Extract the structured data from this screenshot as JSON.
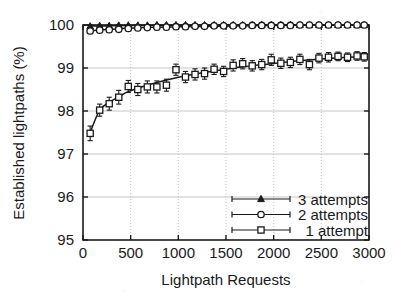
{
  "chart_data": {
    "type": "line",
    "title": "",
    "xlabel": "Lightpath Requests",
    "ylabel": "Established lightpaths (%)",
    "xlim": [
      0,
      3000
    ],
    "ylim": [
      95,
      100
    ],
    "xticks": [
      0,
      500,
      1000,
      1500,
      2000,
      2500,
      3000
    ],
    "yticks": [
      95,
      96,
      97,
      98,
      99,
      100
    ],
    "grid": true,
    "legend_position": "bottom-right",
    "x": [
      75,
      175,
      275,
      375,
      475,
      575,
      675,
      775,
      875,
      975,
      1075,
      1175,
      1275,
      1375,
      1475,
      1575,
      1675,
      1775,
      1875,
      1975,
      2075,
      2175,
      2275,
      2375,
      2475,
      2575,
      2675,
      2775,
      2875,
      2950
    ],
    "series": [
      {
        "name": "3 attempts",
        "marker": "triangle",
        "values": [
          99.97,
          99.98,
          99.98,
          99.99,
          99.99,
          99.99,
          99.99,
          100.0,
          100.0,
          100.0,
          100.0,
          100.0,
          100.0,
          100.0,
          100.0,
          100.0,
          100.0,
          100.0,
          100.0,
          100.0,
          100.0,
          100.0,
          100.0,
          100.0,
          100.0,
          100.0,
          100.0,
          100.0,
          100.0,
          100.0
        ],
        "errors": [
          0.03,
          0.02,
          0.02,
          0.02,
          0.01,
          0.01,
          0.01,
          0.01,
          0.01,
          0.01,
          0.01,
          0.01,
          0.01,
          0.01,
          0.0,
          0.0,
          0.0,
          0.0,
          0.0,
          0.0,
          0.0,
          0.0,
          0.0,
          0.0,
          0.0,
          0.0,
          0.0,
          0.0,
          0.0,
          0.0
        ]
      },
      {
        "name": "2 attempts",
        "marker": "circle",
        "values": [
          99.86,
          99.88,
          99.89,
          99.9,
          99.92,
          99.93,
          99.94,
          99.95,
          99.95,
          99.96,
          99.96,
          99.97,
          99.97,
          99.98,
          99.98,
          99.98,
          99.98,
          99.99,
          99.99,
          99.99,
          99.99,
          99.99,
          100.0,
          100.0,
          100.0,
          100.0,
          100.0,
          100.0,
          100.0,
          100.0
        ],
        "errors": [
          0.06,
          0.05,
          0.05,
          0.05,
          0.04,
          0.04,
          0.03,
          0.03,
          0.03,
          0.03,
          0.02,
          0.02,
          0.02,
          0.02,
          0.02,
          0.02,
          0.01,
          0.01,
          0.01,
          0.01,
          0.01,
          0.01,
          0.01,
          0.01,
          0.01,
          0.01,
          0.01,
          0.01,
          0.0,
          0.0
        ]
      },
      {
        "name": "1 attempt",
        "marker": "square",
        "values": [
          97.48,
          98.02,
          98.17,
          98.32,
          98.57,
          98.5,
          98.56,
          98.56,
          98.6,
          98.96,
          98.79,
          98.85,
          98.87,
          98.97,
          98.92,
          99.06,
          99.1,
          99.05,
          99.08,
          99.19,
          99.11,
          99.13,
          99.2,
          99.08,
          99.23,
          99.25,
          99.27,
          99.25,
          99.28,
          99.26
        ],
        "errors": [
          0.17,
          0.14,
          0.15,
          0.16,
          0.14,
          0.14,
          0.14,
          0.14,
          0.14,
          0.13,
          0.13,
          0.13,
          0.13,
          0.12,
          0.12,
          0.13,
          0.12,
          0.12,
          0.12,
          0.13,
          0.12,
          0.12,
          0.12,
          0.12,
          0.11,
          0.11,
          0.1,
          0.1,
          0.1,
          0.1
        ]
      }
    ],
    "fit_curves": [
      {
        "name": "3 attempts",
        "points": [
          [
            75,
            99.975
          ],
          [
            300,
            99.985
          ],
          [
            700,
            99.993
          ],
          [
            1200,
            99.998
          ],
          [
            2000,
            100.0
          ],
          [
            3000,
            100.0
          ]
        ]
      },
      {
        "name": "2 attempts",
        "points": [
          [
            75,
            99.865
          ],
          [
            300,
            99.9
          ],
          [
            700,
            99.945
          ],
          [
            1200,
            99.968
          ],
          [
            2000,
            99.99
          ],
          [
            3000,
            100.0
          ]
        ]
      },
      {
        "name": "1 attempt",
        "points": [
          [
            75,
            97.5
          ],
          [
            175,
            98.02
          ],
          [
            275,
            98.2
          ],
          [
            375,
            98.33
          ],
          [
            475,
            98.45
          ],
          [
            675,
            98.6
          ],
          [
            875,
            98.72
          ],
          [
            1075,
            98.82
          ],
          [
            1375,
            98.93
          ],
          [
            1675,
            99.03
          ],
          [
            1975,
            99.1
          ],
          [
            2275,
            99.17
          ],
          [
            2575,
            99.22
          ],
          [
            2950,
            99.27
          ]
        ]
      }
    ]
  },
  "axes": {
    "y_title": "Established lightpaths (%)",
    "x_title": "Lightpath Requests",
    "x_tick_labels": [
      "0",
      "500",
      "1000",
      "1500",
      "2000",
      "2500",
      "3000"
    ],
    "y_tick_labels": [
      "95",
      "96",
      "97",
      "98",
      "99",
      "100"
    ]
  },
  "legend": {
    "items": [
      {
        "label": "3 attempts",
        "marker": "triangle-icon"
      },
      {
        "label": "2 attempts",
        "marker": "circle-icon"
      },
      {
        "label": "1 attempt",
        "marker": "square-icon"
      }
    ]
  },
  "colors": {
    "ink": "#1a1a1a",
    "grid": "#b8b8b8",
    "axis": "#1a1a1a",
    "background": "#ffffff"
  }
}
